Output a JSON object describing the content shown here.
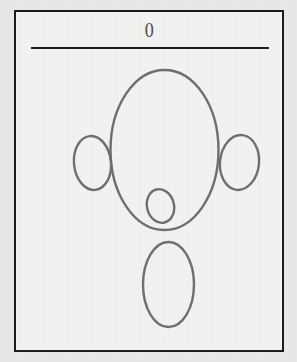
{
  "page": {
    "number_label": "0",
    "background_color": "#e9e9e7",
    "paper_color": "#f3f3f2",
    "frame_border_color": "#181818",
    "rule_color": "#1b1b1b",
    "ink_color": "#6d6d6d",
    "width": 297,
    "height": 362
  },
  "figure": {
    "stroke_color": "#6d6d6d",
    "stroke_width": 2.4,
    "shapes": [
      {
        "name": "head-ellipse",
        "cx": 148.5,
        "cy": 138.0,
        "rx": 54.0,
        "ry": 80.0
      },
      {
        "name": "left-ear-ellipse",
        "cx": 76.5,
        "cy": 151.0,
        "rx": 18.5,
        "ry": 27.0
      },
      {
        "name": "right-ear-ellipse",
        "cx": 223.5,
        "cy": 150.5,
        "rx": 19.5,
        "ry": 27.5
      },
      {
        "name": "nose-ellipse",
        "cx": 144.5,
        "cy": 194.0,
        "rx": 13.5,
        "ry": 17.0
      },
      {
        "name": "body-ellipse",
        "cx": 152.5,
        "cy": 272.5,
        "rx": 25.5,
        "ry": 42.5
      }
    ]
  }
}
